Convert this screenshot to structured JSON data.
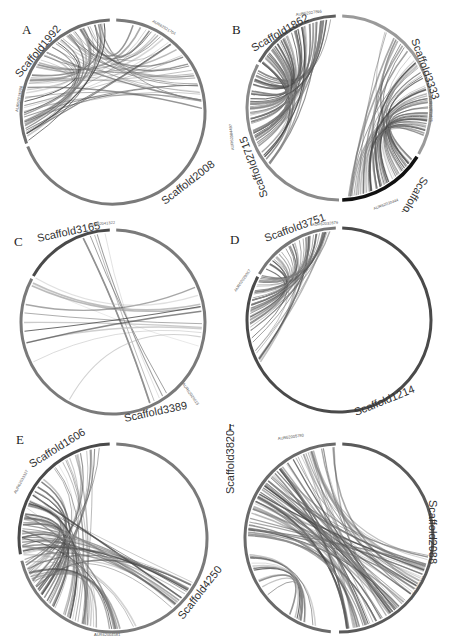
{
  "figure": {
    "type": "circos-synteny-plots",
    "panels": [
      {
        "letter": "A",
        "scaffolds": [
          {
            "name": "Scaffold1992",
            "color": "#6e6e6e"
          },
          {
            "name": "Scaffold2008",
            "color": "#7a7a7a"
          }
        ],
        "genes": [
          "AUR62021704",
          "AUR62024998"
        ],
        "link_count_approx": 60
      },
      {
        "letter": "B",
        "scaffolds": [
          {
            "name": "Scaffold1862",
            "color": "#5e5e5e"
          },
          {
            "name": "Scaffold3333",
            "color": "#9a9a9a"
          },
          {
            "name": "Scaffold3514",
            "color": "#111111"
          },
          {
            "name": "Scaffold2715",
            "color": "#8a8a8a"
          }
        ],
        "genes": [
          "AUR62027866",
          "AUR62011825",
          "AUR62030444",
          "AUR62004497"
        ],
        "link_count_approx": 120
      },
      {
        "letter": "C",
        "scaffolds": [
          {
            "name": "Scaffold3165",
            "color": "#4a4a4a"
          },
          {
            "name": "Scaffold3389",
            "color": "#7a7a7a"
          }
        ],
        "genes": [
          "AUR62041322",
          "AUR62024615"
        ],
        "link_count_approx": 15
      },
      {
        "letter": "D",
        "scaffolds": [
          {
            "name": "Scaffold3751",
            "color": "#777777"
          },
          {
            "name": "Scaffold1214",
            "color": "#4a4a4a"
          }
        ],
        "genes": [
          "AUR62032879",
          "AUR62029067"
        ],
        "link_count_approx": 45
      },
      {
        "letter": "E",
        "scaffolds": [
          {
            "name": "Scaffold1606",
            "color": "#4a4a4a"
          },
          {
            "name": "Scaffold4250",
            "color": "#7a7a7a"
          }
        ],
        "genes": [
          "AUR62033327",
          "AUR62004581"
        ],
        "link_count_approx": 70
      },
      {
        "letter": "F",
        "scaffolds": [
          {
            "name": "Scaffold3820",
            "color": "#6a6a6a"
          },
          {
            "name": "Scaffold2088",
            "color": "#5a5a5a"
          }
        ],
        "genes": [
          "AUR62005780",
          "AUR62008777"
        ],
        "link_count_approx": 90
      }
    ]
  },
  "labels": {
    "A": {
      "letter": "A",
      "s1": "Scaffold1992",
      "s2": "Scaffold2008",
      "g1": "AUR62021704",
      "g2": "AUR62024998"
    },
    "B": {
      "letter": "B",
      "s1": "Scaffold1862",
      "s2": "Scaffold3333",
      "s3": "Scaffold3514",
      "s4": "Scaffold2715",
      "g1": "AUR62027866",
      "g2": "AUR62011825",
      "g3": "AUR62030444",
      "g4": "AUR62004497"
    },
    "C": {
      "letter": "C",
      "s1": "Scaffold3165",
      "s2": "Scaffold3389",
      "g1": "AUR62041322",
      "g2": "AUR62024615"
    },
    "D": {
      "letter": "D",
      "s1": "Scaffold3751",
      "s2": "Scaffold1214",
      "g1": "AUR62032879",
      "g2": "AUR62029067"
    },
    "E": {
      "letter": "E",
      "s1": "Scaffold1606",
      "s2": "Scaffold4250",
      "g1": "AUR62033327",
      "g2": "AUR62004581"
    },
    "F": {
      "letter": "F",
      "s1": "Scaffold3820",
      "s2": "Scaffold2088",
      "g1": "AUR62005780",
      "g2": "AUR62008777"
    }
  }
}
